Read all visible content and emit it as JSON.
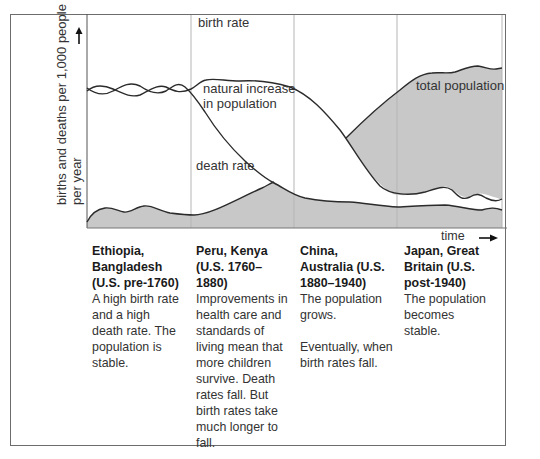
{
  "diagram": {
    "y_axis_label_line1": "births and deaths per 1,000 people",
    "y_axis_label_line2": "per year",
    "x_axis_label": "time",
    "curve_labels": {
      "birth_rate": "birth rate",
      "natural_increase_line1": "natural increase",
      "natural_increase_line2": "in population",
      "death_rate": "death rate",
      "total_population": "total population"
    },
    "colors": {
      "shade": "#c8c8c8",
      "line": "#2b2b2b",
      "separator": "#b5b5b5",
      "frame": "#6d6d6d"
    },
    "stages": [
      {
        "title_lines": [
          "Ethiopia,",
          "Bangladesh",
          "(U.S. pre-1760)"
        ],
        "description": [
          "A high birth rate and a high death rate. The population is stable."
        ]
      },
      {
        "title_lines": [
          "Peru, Kenya",
          "(U.S. 1760–",
          "1880)"
        ],
        "description": [
          "Improvements in health care and standards of living mean that more children survive. Death rates fall. But birth rates take much longer to fall."
        ]
      },
      {
        "title_lines": [
          "China,",
          "Australia (U.S.",
          "1880–1940)"
        ],
        "description": [
          "The population grows.",
          "Eventually, when birth rates fall."
        ]
      },
      {
        "title_lines": [
          "Japan, Great",
          "Britain (U.S.",
          "post-1940)"
        ],
        "description": [
          "The population becomes stable."
        ]
      }
    ]
  }
}
